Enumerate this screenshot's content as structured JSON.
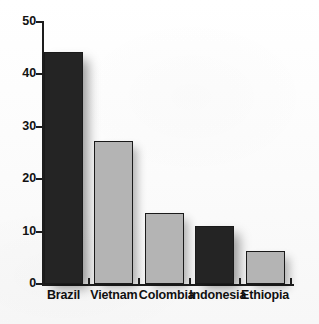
{
  "chart_data": {
    "type": "bar",
    "title": "",
    "subtitle": "",
    "xlabel": "",
    "ylabel": "",
    "categories": [
      "Brazil",
      "Vietnam",
      "Colombia",
      "Indonesia",
      "Ethiopia"
    ],
    "values": [
      44.3,
      27.3,
      13.5,
      11.0,
      6.3
    ],
    "bar_styles": [
      "dark",
      "light",
      "light",
      "dark",
      "light"
    ],
    "ylim": [
      0,
      50
    ],
    "y_ticks": [
      0,
      10,
      20,
      30,
      40,
      50
    ],
    "y_tick_labels": [
      "0",
      "10",
      "20",
      "30",
      "40",
      "50"
    ],
    "grid": false,
    "legend": null,
    "colors": {
      "bar_dark": "#242424",
      "bar_light": "#b4b4b4",
      "bar_outline": "#1a1a1a",
      "axis": "#1d1d1d",
      "text": "#101010",
      "background": "#fdfdfd"
    }
  }
}
